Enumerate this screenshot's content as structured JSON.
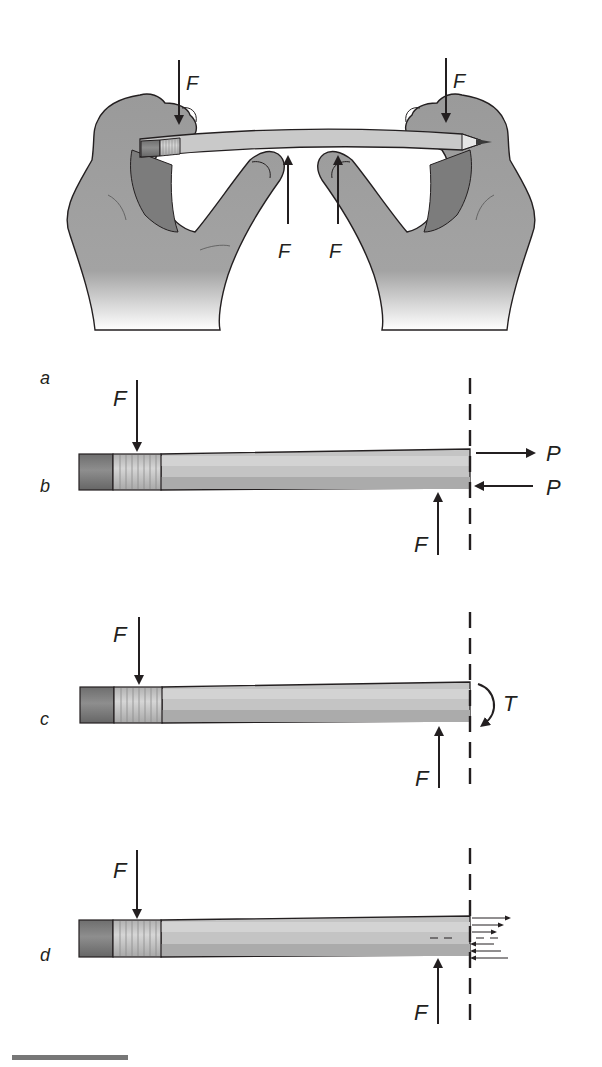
{
  "figure": {
    "panels": [
      {
        "id": "a",
        "label": "a",
        "description": "Two hands bending a pencil",
        "forces": [
          {
            "symbol": "F",
            "direction": "down",
            "location": "left thumb"
          },
          {
            "symbol": "F",
            "direction": "down",
            "location": "right thumb"
          },
          {
            "symbol": "F",
            "direction": "up",
            "location": "left index finger"
          },
          {
            "symbol": "F",
            "direction": "up",
            "location": "right index finger"
          }
        ]
      },
      {
        "id": "b",
        "label": "b",
        "description": "Free body of pencil section with axial forces",
        "forces": [
          {
            "symbol": "F",
            "direction": "down"
          },
          {
            "symbol": "F",
            "direction": "up"
          },
          {
            "symbol": "P",
            "direction": "right",
            "position": "top"
          },
          {
            "symbol": "P",
            "direction": "left",
            "position": "bottom"
          }
        ]
      },
      {
        "id": "c",
        "label": "c",
        "description": "Free body of pencil section with internal moment",
        "forces": [
          {
            "symbol": "F",
            "direction": "down"
          },
          {
            "symbol": "F",
            "direction": "up"
          },
          {
            "symbol": "T",
            "direction": "clockwise moment"
          }
        ]
      },
      {
        "id": "d",
        "label": "d",
        "description": "Free body of pencil section with distributed stress",
        "forces": [
          {
            "symbol": "F",
            "direction": "down"
          },
          {
            "symbol": "F",
            "direction": "up"
          },
          {
            "symbol": "",
            "direction": "distributed tension top / compression bottom"
          }
        ]
      }
    ],
    "labels": {
      "F": "F",
      "P": "P",
      "T": "T",
      "a": "a",
      "b": "b",
      "c": "c",
      "d": "d"
    },
    "colors": {
      "ink": "#231f20",
      "hand": "#9a9a9a",
      "hand_dark": "#7a7a7a",
      "pencil_light": "#cfcfcf",
      "pencil_mid": "#b8b8b8",
      "pencil_dark": "#a4a4a4",
      "eraser": "#777777",
      "ferrule": "#c4c4c4",
      "caption_rule": "#777777"
    }
  }
}
